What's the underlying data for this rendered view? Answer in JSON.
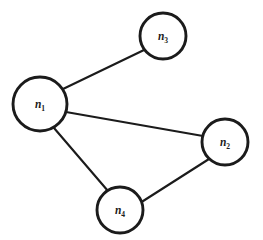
{
  "diagram": {
    "type": "node-link-graph",
    "background_color": "#ffffff",
    "node_fill_color": "#ffffff",
    "node_stroke_color": "#1b1b1b",
    "edge_color": "#1b1b1b",
    "label_color": "#1b1b1b",
    "nodes": [
      {
        "id": "n1",
        "base": "n",
        "subscript": "1",
        "label": "n1",
        "cx": 40,
        "cy": 104,
        "r": 27
      },
      {
        "id": "n2",
        "base": "n",
        "subscript": "2",
        "label": "n2",
        "cx": 225,
        "cy": 142,
        "r": 23
      },
      {
        "id": "n3",
        "base": "n",
        "subscript": "3",
        "label": "n3",
        "cx": 163,
        "cy": 36,
        "r": 23
      },
      {
        "id": "n4",
        "base": "n",
        "subscript": "4",
        "label": "n4",
        "cx": 120,
        "cy": 210,
        "r": 23
      }
    ],
    "edges": [
      {
        "id": "edge-n1-n3",
        "source": "n1",
        "target": "n3",
        "x1": 63,
        "y1": 89,
        "x2": 144,
        "y2": 50
      },
      {
        "id": "edge-n1-n2",
        "source": "n1",
        "target": "n2",
        "x1": 66,
        "y1": 112,
        "x2": 203,
        "y2": 136
      },
      {
        "id": "edge-n1-n4",
        "source": "n1",
        "target": "n4",
        "x1": 54,
        "y1": 128,
        "x2": 108,
        "y2": 191
      },
      {
        "id": "edge-n2-n4",
        "source": "n2",
        "target": "n4",
        "x1": 209,
        "y1": 159,
        "x2": 140,
        "y2": 203
      }
    ]
  }
}
